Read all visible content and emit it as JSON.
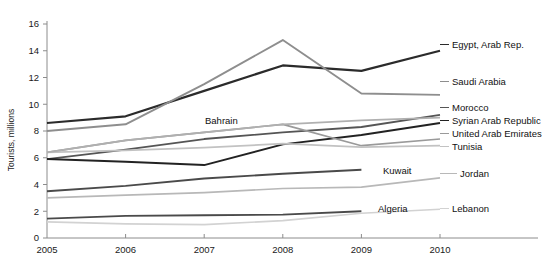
{
  "chart_data": {
    "type": "line",
    "title": "",
    "xlabel": "",
    "ylabel": "Tourists, millions",
    "x": [
      2005,
      2006,
      2007,
      2008,
      2009,
      2010
    ],
    "xtick_labels": [
      "2005",
      "2006",
      "2007",
      "2008",
      "2009",
      "2010"
    ],
    "ytick_labels": [
      "0",
      "2",
      "4",
      "6",
      "8",
      "10",
      "12",
      "14",
      "16"
    ],
    "yticks": [
      0,
      2,
      4,
      6,
      8,
      10,
      12,
      14,
      16
    ],
    "ylim": [
      0,
      16
    ],
    "xlim": [
      2005,
      2010
    ],
    "grid": false,
    "legend_position": "right-inline-labels",
    "series": [
      {
        "name": "Egypt, Arab Rep.",
        "label": "Egypt, Arab Rep.",
        "color": "#2b2b2b",
        "width": 2.2,
        "values": [
          8.6,
          9.1,
          11.0,
          12.9,
          12.5,
          14.0
        ],
        "label_x": 452,
        "label_y": 48,
        "leader_from_x": 440,
        "leader_from_y": 44.5,
        "leader_to_x": 449,
        "leader_to_y": 44.5
      },
      {
        "name": "Saudi Arabia",
        "label": "Saudi Arabia",
        "color": "#8e8e8e",
        "width": 1.9,
        "values": [
          8.0,
          8.5,
          11.5,
          14.8,
          10.8,
          10.7
        ],
        "label_x": 452,
        "label_y": 85,
        "leader_from_x": 440,
        "leader_from_y": 81.5,
        "leader_to_x": 449,
        "leader_to_y": 81.5
      },
      {
        "name": "Morocco",
        "label": "Morocco",
        "color": "#555555",
        "width": 1.8,
        "values": [
          5.9,
          6.6,
          7.4,
          7.9,
          8.3,
          9.2
        ],
        "label_x": 452,
        "label_y": 111,
        "leader_from_x": 440,
        "leader_from_y": 107.5,
        "leader_to_x": 449,
        "leader_to_y": 107.5
      },
      {
        "name": "Syrian Arab Republic",
        "label": "Syrian Arab Republic",
        "color": "#222222",
        "width": 2.0,
        "values": [
          5.9,
          5.7,
          5.45,
          7.0,
          7.7,
          8.6
        ],
        "label_x": 452,
        "label_y": 124,
        "leader_from_x": 440,
        "leader_from_y": 120.5,
        "leader_to_x": 449,
        "leader_to_y": 120.5
      },
      {
        "name": "United Arab Emirates",
        "label": "United Arab Emirates",
        "color": "#9a9a9a",
        "width": 1.7,
        "values": [
          6.4,
          7.3,
          7.9,
          8.5,
          6.9,
          7.4
        ],
        "label_x": 452,
        "label_y": 137,
        "leader_from_x": 440,
        "leader_from_y": 133.5,
        "leader_to_x": 449,
        "leader_to_y": 133.5
      },
      {
        "name": "Tunisia",
        "label": "Tunisia",
        "color": "#c2c2c2",
        "width": 1.7,
        "values": [
          6.4,
          6.55,
          6.76,
          7.05,
          6.8,
          6.9
        ],
        "label_x": 452,
        "label_y": 150,
        "leader_from_x": 440,
        "leader_from_y": 146.5,
        "leader_to_x": 449,
        "leader_to_y": 146.5
      },
      {
        "name": "Bahrain",
        "label": "Bahrain",
        "color": "#b0b0b0",
        "width": 1.7,
        "values": [
          6.4,
          7.3,
          7.9,
          8.5,
          8.8,
          9.0
        ],
        "label_x": 205,
        "label_y": 124,
        "leader_from_x": 0,
        "leader_from_y": 0,
        "leader_to_x": 0,
        "leader_to_y": 0
      },
      {
        "name": "Kuwait",
        "label": "Kuwait",
        "color": "#4a4a4a",
        "width": 1.9,
        "values": [
          3.5,
          3.9,
          4.45,
          4.8,
          5.1,
          null
        ],
        "label_x": 383,
        "label_y": 174,
        "leader_from_x": 0,
        "leader_from_y": 0,
        "leader_to_x": 0,
        "leader_to_y": 0
      },
      {
        "name": "Jordan",
        "label": "Jordan",
        "color": "#b8b8b8",
        "width": 1.7,
        "values": [
          3.0,
          3.2,
          3.4,
          3.7,
          3.8,
          4.5
        ],
        "label_x": 460,
        "label_y": 177,
        "leader_from_x": 440,
        "leader_from_y": 173.5,
        "leader_to_x": 457,
        "leader_to_y": 173.5
      },
      {
        "name": "Algeria",
        "label": "Algeria",
        "color": "#4a4a4a",
        "width": 1.8,
        "values": [
          1.45,
          1.65,
          1.7,
          1.75,
          2.0,
          null
        ],
        "label_x": 378,
        "label_y": 212,
        "leader_from_x": 0,
        "leader_from_y": 0,
        "leader_to_x": 0,
        "leader_to_y": 0
      },
      {
        "name": "Lebanon",
        "label": "Lebanon",
        "color": "#d2d2d2",
        "width": 1.7,
        "values": [
          1.2,
          1.05,
          1.0,
          1.3,
          1.85,
          2.15
        ],
        "label_x": 452,
        "label_y": 212,
        "leader_from_x": 440,
        "leader_from_y": 208.5,
        "leader_to_x": 449,
        "leader_to_y": 208.5
      }
    ]
  },
  "axes": {
    "y_title": "Tourists, millions"
  }
}
